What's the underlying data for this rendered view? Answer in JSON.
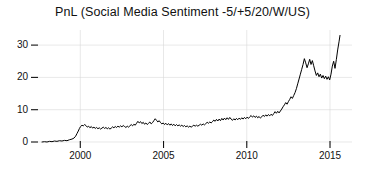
{
  "chart_data": {
    "type": "line",
    "title": "PnL (Social Media Sentiment -5/+5/20/W/US)",
    "xlabel": "",
    "ylabel": "",
    "xlim": [
      1997.6,
      1905.0
    ],
    "ylim": [
      -1.5,
      34.0
    ],
    "xticks": [
      2000,
      2005,
      2010,
      2015
    ],
    "xticklabels": [
      "2000",
      "2005",
      "2010",
      "2015"
    ],
    "yticks": [
      0,
      10,
      20,
      30
    ],
    "yticklabels": [
      "0",
      "10",
      "20",
      "30"
    ],
    "grid": true,
    "grid_color": "#d8d8d8",
    "line_color": "#000000",
    "line_width": 1.0,
    "legend": null,
    "series": [
      {
        "name": "PnL",
        "x": [
          1997.7,
          1997.85,
          1998.0,
          1998.15,
          1998.3,
          1998.45,
          1998.6,
          1998.75,
          1998.9,
          1999.05,
          1999.2,
          1999.35,
          1999.5,
          1999.62,
          1999.72,
          1999.8,
          1999.88,
          1999.95,
          2000.02,
          2000.1,
          2000.18,
          2000.26,
          2000.34,
          2000.42,
          2000.5,
          2000.58,
          2000.66,
          2000.74,
          2000.82,
          2000.9,
          2000.98,
          2001.06,
          2001.14,
          2001.22,
          2001.3,
          2001.38,
          2001.46,
          2001.54,
          2001.62,
          2001.7,
          2001.78,
          2001.86,
          2001.94,
          2002.02,
          2002.1,
          2002.18,
          2002.26,
          2002.34,
          2002.42,
          2002.5,
          2002.58,
          2002.66,
          2002.74,
          2002.82,
          2002.9,
          2002.98,
          2003.06,
          2003.14,
          2003.22,
          2003.3,
          2003.38,
          2003.46,
          2003.54,
          2003.62,
          2003.7,
          2003.78,
          2003.86,
          2003.94,
          2004.02,
          2004.1,
          2004.18,
          2004.26,
          2004.34,
          2004.42,
          2004.5,
          2004.58,
          2004.66,
          2004.74,
          2004.82,
          2004.9,
          2004.98,
          2005.06,
          2005.14,
          2005.22,
          2005.3,
          2005.38,
          2005.46,
          2005.54,
          2005.62,
          2005.7,
          2005.78,
          2005.86,
          2005.94,
          2006.02,
          2006.1,
          2006.18,
          2006.26,
          2006.34,
          2006.42,
          2006.5,
          2006.58,
          2006.66,
          2006.74,
          2006.82,
          2006.9,
          2006.98,
          2007.06,
          2007.14,
          2007.22,
          2007.3,
          2007.38,
          2007.46,
          2007.54,
          2007.62,
          2007.7,
          2007.78,
          2007.86,
          2007.94,
          2008.02,
          2008.1,
          2008.18,
          2008.26,
          2008.34,
          2008.42,
          2008.5,
          2008.58,
          2008.66,
          2008.74,
          2008.82,
          2008.9,
          2008.98,
          2009.06,
          2009.14,
          2009.22,
          2009.3,
          2009.38,
          2009.46,
          2009.54,
          2009.62,
          2009.7,
          2009.78,
          2009.86,
          2009.94,
          2010.02,
          2010.1,
          2010.18,
          2010.26,
          2010.34,
          2010.42,
          2010.5,
          2010.58,
          2010.66,
          2010.74,
          2010.82,
          2010.9,
          2010.98,
          2011.06,
          2011.14,
          2011.22,
          2011.3,
          2011.38,
          2011.46,
          2011.54,
          2011.62,
          2011.7,
          2011.78,
          2011.86,
          2011.94,
          2012.02,
          2012.1,
          2012.18,
          2012.26,
          2012.34,
          2012.42,
          2012.5,
          2012.58,
          2012.66,
          2012.74,
          2012.82,
          2012.9,
          2012.98,
          2013.06,
          2013.14,
          2013.22,
          2013.3,
          2013.38,
          2013.46,
          2013.54,
          2013.62,
          2013.7,
          2013.78,
          2013.86,
          2013.94,
          2014.02,
          2014.1,
          2014.18,
          2014.26,
          2014.34,
          2014.42,
          2014.5,
          2014.58,
          2014.66,
          2014.74,
          2014.82,
          2014.9,
          2014.98,
          2015.06,
          2015.14,
          2015.22,
          2015.3,
          2015.38,
          2015.46,
          2015.54,
          2015.6
        ],
        "y": [
          0.0,
          0.1,
          0.0,
          0.2,
          0.1,
          0.3,
          0.2,
          0.4,
          0.3,
          0.5,
          0.4,
          0.7,
          0.9,
          1.2,
          1.8,
          2.6,
          3.4,
          4.2,
          4.8,
          5.2,
          5.0,
          5.4,
          5.1,
          4.6,
          4.9,
          4.4,
          4.8,
          4.3,
          4.6,
          4.2,
          4.5,
          4.1,
          4.4,
          4.0,
          4.3,
          4.6,
          4.2,
          4.5,
          4.1,
          4.4,
          4.0,
          4.3,
          4.7,
          4.4,
          4.8,
          4.5,
          4.9,
          4.6,
          5.0,
          4.7,
          5.1,
          4.8,
          4.5,
          4.9,
          4.6,
          5.0,
          5.4,
          5.0,
          5.5,
          5.2,
          5.8,
          6.4,
          5.9,
          6.3,
          5.7,
          6.1,
          5.5,
          5.9,
          5.4,
          5.8,
          6.2,
          5.6,
          6.0,
          6.6,
          7.2,
          6.7,
          6.2,
          6.6,
          6.0,
          5.6,
          5.9,
          5.4,
          5.8,
          5.3,
          5.7,
          5.2,
          5.6,
          5.1,
          5.5,
          5.0,
          5.4,
          5.0,
          5.3,
          4.9,
          5.2,
          4.8,
          5.1,
          4.7,
          5.0,
          4.6,
          4.9,
          4.6,
          4.9,
          5.2,
          4.9,
          5.2,
          4.9,
          5.2,
          5.5,
          5.2,
          5.6,
          5.3,
          5.7,
          6.1,
          5.8,
          6.2,
          5.9,
          6.3,
          6.8,
          6.4,
          7.0,
          6.5,
          7.1,
          6.6,
          7.3,
          6.8,
          7.4,
          6.9,
          7.5,
          7.0,
          7.6,
          7.1,
          6.7,
          7.2,
          6.8,
          7.3,
          6.9,
          7.4,
          7.0,
          7.5,
          7.1,
          7.6,
          7.2,
          7.7,
          7.3,
          7.8,
          8.2,
          7.7,
          8.1,
          7.6,
          8.0,
          7.5,
          7.9,
          7.4,
          7.8,
          8.3,
          7.9,
          8.4,
          8.0,
          8.5,
          8.1,
          8.6,
          8.2,
          8.8,
          9.4,
          8.9,
          9.5,
          9.0,
          9.6,
          10.2,
          10.9,
          11.5,
          12.2,
          11.7,
          12.5,
          13.2,
          14.0,
          13.5,
          14.4,
          15.3,
          16.5,
          18.0,
          19.5,
          21.0,
          22.5,
          24.0,
          25.8,
          24.5,
          23.0,
          24.2,
          25.6,
          24.0,
          25.2,
          23.6,
          22.0,
          20.6,
          21.4,
          20.2,
          21.0,
          19.8,
          20.6,
          19.6,
          20.4,
          19.4,
          20.2,
          19.2,
          21.0,
          23.5,
          25.0,
          22.8,
          25.5,
          28.5,
          31.0,
          33.0
        ]
      }
    ]
  },
  "axis": {
    "ytick_dash": "–",
    "xtick_mark": "|"
  }
}
